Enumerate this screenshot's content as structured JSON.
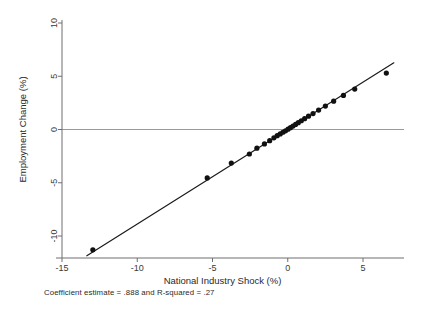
{
  "figure": {
    "background_color": "#ffffff",
    "caption": "Coefficient estimate = .888 and R-squared = .27"
  },
  "chart_data": {
    "type": "scatter",
    "title": "",
    "xlabel": "National Industry Shock (%)",
    "ylabel": "Employment Change (%)",
    "xlim": [
      -16.0,
      7.6
    ],
    "ylim": [
      -12.5,
      11.0
    ],
    "xticks": [
      -15,
      -10,
      -5,
      0,
      5
    ],
    "yticks": [
      -10,
      -5,
      0,
      5,
      10
    ],
    "xtick_labels": [
      "-15",
      "-10",
      "-5",
      "0",
      "5"
    ],
    "ytick_labels": [
      "-10",
      "-5",
      "0",
      "5",
      "10"
    ],
    "grid": false,
    "legend": false,
    "zero_reference_line": {
      "y": 0,
      "color": "#9a9a9a",
      "width": 1
    },
    "marker": {
      "shape": "circle",
      "color": "#111111",
      "size": 4.0
    },
    "points": [
      {
        "x": -12.95,
        "y": -11.3
      },
      {
        "x": -5.35,
        "y": -4.55
      },
      {
        "x": -3.75,
        "y": -3.15
      },
      {
        "x": -2.55,
        "y": -2.3
      },
      {
        "x": -2.05,
        "y": -1.75
      },
      {
        "x": -1.55,
        "y": -1.35
      },
      {
        "x": -1.2,
        "y": -1.05
      },
      {
        "x": -0.92,
        "y": -0.78
      },
      {
        "x": -0.7,
        "y": -0.58
      },
      {
        "x": -0.5,
        "y": -0.42
      },
      {
        "x": -0.32,
        "y": -0.26
      },
      {
        "x": -0.15,
        "y": -0.12
      },
      {
        "x": 0.02,
        "y": 0.03
      },
      {
        "x": 0.18,
        "y": 0.17
      },
      {
        "x": 0.35,
        "y": 0.32
      },
      {
        "x": 0.52,
        "y": 0.48
      },
      {
        "x": 0.7,
        "y": 0.64
      },
      {
        "x": 0.9,
        "y": 0.82
      },
      {
        "x": 1.12,
        "y": 1.02
      },
      {
        "x": 1.38,
        "y": 1.25
      },
      {
        "x": 1.68,
        "y": 1.5
      },
      {
        "x": 2.05,
        "y": 1.82
      },
      {
        "x": 2.5,
        "y": 2.2
      },
      {
        "x": 3.05,
        "y": 2.66
      },
      {
        "x": 3.7,
        "y": 3.2
      },
      {
        "x": 4.45,
        "y": 3.8
      },
      {
        "x": 6.55,
        "y": 5.3
      }
    ],
    "fit_line": {
      "slope": 0.888,
      "intercept": 0.0,
      "x_start": -13.35,
      "x_end": 7.05,
      "color": "#1a1a1a",
      "width": 1.2
    },
    "annotations": [
      "Coefficient estimate = .888 and R-squared = .27"
    ],
    "statistics": {
      "coefficient_estimate": 0.888,
      "r_squared": 0.27
    }
  }
}
